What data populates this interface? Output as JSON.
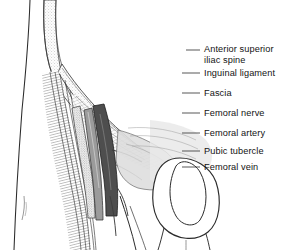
{
  "figure": {
    "type": "anatomical-illustration",
    "view": "anterior oblique, right groin and upper thigh",
    "style": "black-and-white line drawing with stipple and hatch shading",
    "background_color": "#ffffff",
    "ink_color": "#131313"
  },
  "labels": [
    {
      "id": "anterior-superior-iliac-spine",
      "text": "Anterior superior iliac spine",
      "line1": "Anterior superior",
      "line2": "iliac spine",
      "lines": 2,
      "text_x": 204,
      "text_y": 44,
      "leader": {
        "x1": 186,
        "y1": 50,
        "x2": 200,
        "y2": 50
      }
    },
    {
      "id": "inguinal-ligament",
      "text": "Inguinal ligament",
      "lines": 1,
      "text_x": 204,
      "text_y": 68,
      "leader": {
        "x1": 182,
        "y1": 73,
        "x2": 200,
        "y2": 73
      }
    },
    {
      "id": "fascia",
      "text": "Fascia",
      "lines": 1,
      "text_x": 204,
      "text_y": 88,
      "leader": {
        "x1": 182,
        "y1": 93,
        "x2": 200,
        "y2": 93
      }
    },
    {
      "id": "femoral-nerve",
      "text": "Femoral  nerve",
      "lines": 1,
      "text_x": 204,
      "text_y": 108,
      "leader": {
        "x1": 182,
        "y1": 113,
        "x2": 200,
        "y2": 113
      }
    },
    {
      "id": "femoral-artery",
      "text": "Femoral  artery",
      "lines": 1,
      "text_x": 204,
      "text_y": 128,
      "leader": {
        "x1": 182,
        "y1": 133,
        "x2": 200,
        "y2": 133
      }
    },
    {
      "id": "pubic-tubercle",
      "text": "Pubic tubercle",
      "lines": 1,
      "text_x": 204,
      "text_y": 146,
      "leader": {
        "x1": 182,
        "y1": 151,
        "x2": 200,
        "y2": 151
      }
    },
    {
      "id": "femoral-vein",
      "text": "Femoral  vein",
      "lines": 1,
      "text_x": 204,
      "text_y": 162,
      "leader": {
        "x1": 182,
        "y1": 167,
        "x2": 200,
        "y2": 167
      }
    }
  ],
  "structures": [
    {
      "id": "iliac-crest-band",
      "name": "Iliac crest / abdominal wall band",
      "shading": "light stipple",
      "tone": "#e2e2e2"
    },
    {
      "id": "inguinal-ligament-band",
      "name": "Inguinal ligament",
      "shading": "stipple band",
      "tone": "#d9d9d9"
    },
    {
      "id": "fascia-lata",
      "name": "Fascia lata",
      "shading": "fine hatch",
      "tone": "#bdbdbd"
    },
    {
      "id": "sartorius-fibers",
      "name": "Sartorius / thigh muscle fibers",
      "shading": "parallel line hatch",
      "tone": "#6a6a6a"
    },
    {
      "id": "femoral-nerve",
      "name": "Femoral nerve",
      "shading": "fine stipple",
      "tone": "#9a9a9a"
    },
    {
      "id": "femoral-artery",
      "name": "Femoral artery",
      "shading": "mid gray",
      "tone": "#8c8c8c"
    },
    {
      "id": "femoral-vein",
      "name": "Femoral vein",
      "shading": "dark gray solid",
      "tone": "#4a4a4a"
    },
    {
      "id": "pubic-tubercle",
      "name": "Pubic tubercle",
      "shading": "light gray",
      "tone": "#d0d0d0"
    },
    {
      "id": "scrotum-outline",
      "name": "Scrotum / genital outline",
      "shading": "outline only",
      "tone": "#ffffff"
    },
    {
      "id": "thigh-outline",
      "name": "Medial thigh outline",
      "shading": "outline only",
      "tone": "#ffffff"
    }
  ]
}
